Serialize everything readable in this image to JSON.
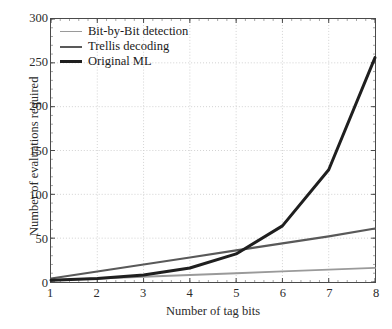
{
  "chart_data": {
    "type": "line",
    "title": "",
    "xlabel": "Number of tag bits",
    "ylabel": "Number of evaluations required",
    "xlim": [
      1,
      8
    ],
    "ylim": [
      0,
      300
    ],
    "xticks": [
      "1",
      "2",
      "3",
      "4",
      "5",
      "6",
      "7",
      "8"
    ],
    "yticks": [
      "0",
      "50",
      "100",
      "150",
      "200",
      "250",
      "300"
    ],
    "grid": true,
    "legend_position": "upper-left",
    "x": [
      1,
      2,
      3,
      4,
      5,
      6,
      7,
      8
    ],
    "series": [
      {
        "name": "Bit-by-Bit detection",
        "color": "#9a9a9a",
        "width": 1.8,
        "values": [
          2,
          4,
          6,
          8,
          10,
          12,
          14,
          16
        ]
      },
      {
        "name": "Trellis decoding",
        "color": "#595959",
        "width": 2.2,
        "values": [
          4,
          12,
          20,
          28,
          36,
          44,
          52,
          61
        ]
      },
      {
        "name": "Original ML",
        "color": "#1f1f1f",
        "width": 3.0,
        "values": [
          2,
          4,
          8,
          16,
          32,
          64,
          128,
          256
        ]
      }
    ]
  },
  "axes": {
    "xlabel": "Number of tag bits",
    "ylabel": "Number of evaluations required",
    "x_tick_labels": [
      "1",
      "2",
      "3",
      "4",
      "5",
      "6",
      "7",
      "8"
    ],
    "y_tick_labels": [
      "0",
      "50",
      "100",
      "150",
      "200",
      "250",
      "300"
    ]
  },
  "legend": {
    "items": [
      {
        "label": "Bit-by-Bit detection",
        "color": "#9a9a9a"
      },
      {
        "label": "Trellis decoding",
        "color": "#595959"
      },
      {
        "label": "Original ML",
        "color": "#1f1f1f"
      }
    ]
  },
  "style": {
    "grid_color": "#d2d2d2",
    "axis_color": "#4a4a4a",
    "text_color": "#2b2b2b",
    "background": "#ffffff"
  }
}
